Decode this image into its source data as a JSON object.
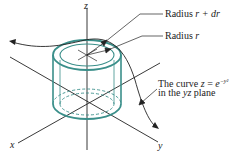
{
  "diagram": {
    "axes": {
      "x_label": "x",
      "y_label": "y",
      "z_label": "z"
    },
    "labels": {
      "outer_radius": {
        "prefix": "Radius ",
        "var": "r + dr"
      },
      "inner_radius": {
        "prefix": "Radius ",
        "var": "r"
      },
      "curve_line1": {
        "prefix": "The curve ",
        "var": "z",
        "eq": " = ",
        "base": "e",
        "exp": "−y²"
      },
      "curve_line2": {
        "prefix": "in the ",
        "var": "yz",
        "suffix": " plane"
      }
    },
    "colors": {
      "cylinder": "#3a8f8a",
      "lines": "#222222"
    }
  }
}
